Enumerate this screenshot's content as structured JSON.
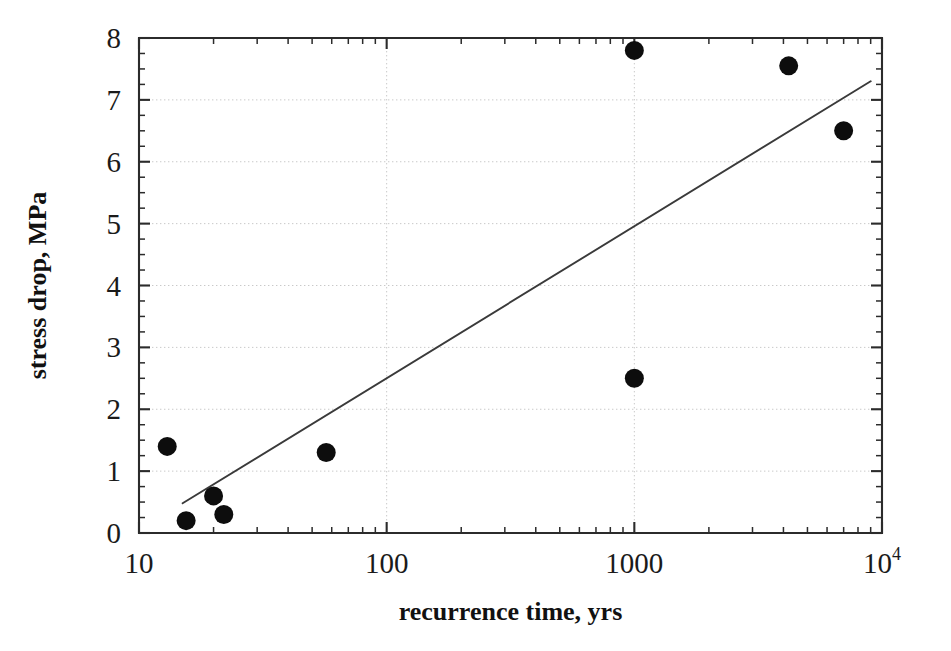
{
  "chart_data": {
    "type": "scatter",
    "title": "",
    "xlabel": "recurrence time, yrs",
    "ylabel": "stress drop, MPa",
    "xscale": "log",
    "yscale": "linear",
    "xlim": [
      10,
      10000
    ],
    "ylim": [
      0,
      8
    ],
    "grid": true,
    "legend": null,
    "x_tick_labels": [
      "10",
      "100",
      "1000",
      "10⁴"
    ],
    "x_tick_values": [
      10,
      100,
      1000,
      10000
    ],
    "y_tick_labels": [
      "0",
      "1",
      "2",
      "3",
      "4",
      "5",
      "6",
      "7",
      "8"
    ],
    "y_tick_values": [
      0,
      1,
      2,
      3,
      4,
      5,
      6,
      7,
      8
    ],
    "y_minor_step": 0.25,
    "points": [
      {
        "x": 13,
        "y": 1.4
      },
      {
        "x": 15.5,
        "y": 0.2
      },
      {
        "x": 20,
        "y": 0.6
      },
      {
        "x": 22,
        "y": 0.3
      },
      {
        "x": 57,
        "y": 1.3
      },
      {
        "x": 1000,
        "y": 7.8
      },
      {
        "x": 1000,
        "y": 2.5
      },
      {
        "x": 4200,
        "y": 7.55
      },
      {
        "x": 7000,
        "y": 6.5
      }
    ],
    "trend_line": {
      "label": "regression line",
      "x_start": 15,
      "y_start": 0.48,
      "x_end": 9000,
      "y_end": 7.3
    },
    "marker": {
      "shape": "circle",
      "radius_px": 9.5,
      "color": "#0d0d0d"
    },
    "colors": {
      "axis": "#2b2b2b",
      "grid": "#c9c9c9",
      "line": "#3a3a3a",
      "marker": "#0d0d0d",
      "text": "#1a1a1a",
      "background": "#ffffff"
    }
  },
  "axis_labels": {
    "x_superscript_base": "10",
    "x_superscript_exp": "4"
  }
}
